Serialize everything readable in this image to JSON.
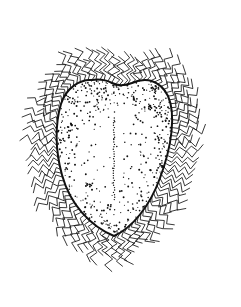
{
  "image": {
    "subject": "stippled line illustration of a hairy ovoid body",
    "width": 241,
    "height": 307,
    "background": "#ffffff",
    "ink": "#1a1a1a",
    "body": {
      "shape": "heart-shaped ovoid, broader at top with slight notch, tapering to bottom",
      "center": [
        103,
        158
      ],
      "outline_color": "#111111",
      "texture": "stipple dots denser toward the margin",
      "median_line": true
    },
    "fringe": {
      "description": "wavy radiating hairs around the entire outline",
      "color": "#222222"
    }
  }
}
